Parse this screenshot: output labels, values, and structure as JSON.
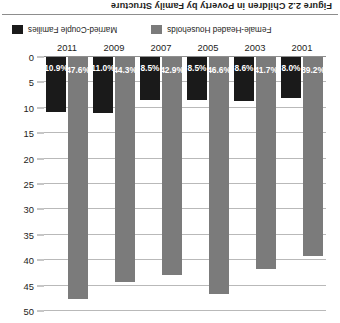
{
  "figure": {
    "number": "Figure 2.2",
    "title": "Children in Poverty by Family Structure",
    "full_title": "Figure 2.2  Children in Poverty by Family Structure",
    "orientation": "rotated-180"
  },
  "legend": {
    "position": "top",
    "items": [
      {
        "label": "Married-Couple Families",
        "color": "#1a1a1a",
        "swatch": "dark-swatch"
      },
      {
        "label": "Female-Headed Households",
        "color": "#7b7b7b",
        "swatch": "gray-swatch"
      }
    ]
  },
  "axes": {
    "y_ticks": [
      "0",
      "5",
      "10",
      "15",
      "20",
      "25",
      "30",
      "35",
      "40",
      "45",
      "50"
    ],
    "x_ticks": [
      "2001",
      "2003",
      "2005",
      "2007",
      "2009",
      "2011"
    ]
  },
  "chart_data": {
    "type": "bar",
    "title": "Figure 2.2  Children in Poverty by Family Structure",
    "subtitle": "",
    "xlabel": "",
    "ylabel": "",
    "ylim": [
      0,
      50
    ],
    "ytick_step": 5,
    "grid": true,
    "legend_position": "top",
    "categories": [
      "2001",
      "2003",
      "2005",
      "2007",
      "2009",
      "2011"
    ],
    "series": [
      {
        "name": "Married-Couple Families",
        "color": "#1a1a1a",
        "values": [
          8.0,
          8.6,
          8.5,
          8.5,
          11.0,
          10.9
        ],
        "labels": [
          "8.0%",
          "8.6%",
          "8.5%",
          "8.5%",
          "11.0%",
          "10.9%"
        ]
      },
      {
        "name": "Female-Headed Households",
        "color": "#7b7b7b",
        "values": [
          39.2,
          41.7,
          46.6,
          42.9,
          44.3,
          47.6
        ],
        "labels": [
          "39.2%",
          "41.7%",
          "46.6%",
          "42.9%",
          "44.3%",
          "47.6%"
        ]
      }
    ]
  }
}
